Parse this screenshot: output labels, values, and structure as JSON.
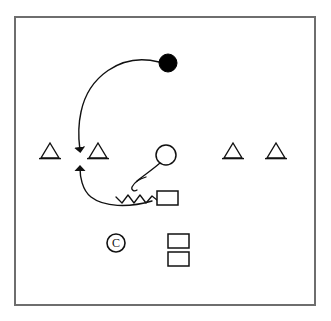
{
  "canvas": {
    "width": 331,
    "height": 321,
    "background": "#ffffff",
    "stroke_color": "#1a1a1a",
    "frame_color": "#6e6e6e"
  },
  "frame": {
    "label": "play-field-border",
    "x": 15,
    "y": 17,
    "width": 300,
    "height": 288,
    "stroke_width": 2
  },
  "legend": {
    "title": "Play Diagram",
    "symbols": [
      {
        "key": "triangle",
        "meaning": "Defender (open triangle)"
      },
      {
        "key": "filled-circle",
        "meaning": "Ball carrier / primary player (filled circle)"
      },
      {
        "key": "open-circle",
        "meaning": "Player (open circle)"
      },
      {
        "key": "rectangle",
        "meaning": "Blocker / lineman (open rectangle)"
      },
      {
        "key": "circled-c",
        "meaning": "Center (circled C)"
      },
      {
        "key": "arrow-path",
        "meaning": "Motion / route with arrowhead"
      },
      {
        "key": "zigzag-path",
        "meaning": "Block / engagement path (zigzag)"
      }
    ]
  },
  "players": {
    "triangles": [
      {
        "name": "defender-1",
        "cx": 50,
        "cy": 158,
        "half_width": 9,
        "height": 15
      },
      {
        "name": "defender-2",
        "cx": 98,
        "cy": 158,
        "half_width": 9,
        "height": 15
      },
      {
        "name": "defender-3",
        "cx": 233,
        "cy": 158,
        "half_width": 9,
        "height": 15
      },
      {
        "name": "defender-4",
        "cx": 276,
        "cy": 158,
        "half_width": 9,
        "height": 15
      }
    ],
    "filled_circle": {
      "name": "ball-carrier",
      "cx": 168,
      "cy": 63,
      "r": 9,
      "fill": "#000000"
    },
    "open_circle": {
      "name": "receiver",
      "cx": 166,
      "cy": 155,
      "r": 10,
      "fill": "#ffffff"
    },
    "circled_c": {
      "name": "center-marker",
      "cx": 116,
      "cy": 243,
      "r": 9,
      "letter": "C"
    },
    "rectangles": [
      {
        "name": "blocker-1",
        "x": 157,
        "y": 191,
        "width": 21,
        "height": 14
      },
      {
        "name": "blocker-2",
        "x": 168,
        "y": 234,
        "width": 21,
        "height": 14
      },
      {
        "name": "blocker-3",
        "x": 168,
        "y": 252,
        "width": 21,
        "height": 14
      }
    ]
  },
  "paths": {
    "upper_route": {
      "name": "ball-carrier-route",
      "d": "M 159 62 C 120 52 88 78 81 112 C 77 130 79 142 80 150",
      "arrow_at": {
        "x": 80,
        "y": 156,
        "direction": "down"
      }
    },
    "lower_route": {
      "name": "blocker-return-route",
      "d": "M 152 201 C 128 208 104 207 91 197 C 82 190 80 176 80 168",
      "arrow_at": {
        "x": 80,
        "y": 160,
        "direction": "up"
      }
    },
    "receiver_stem": {
      "name": "receiver-release-path",
      "d": "M 160 163 C 152 170 143 176 137 181"
    },
    "receiver_hook": {
      "name": "receiver-hook-curl",
      "d": "M 145 183 C 139 181 135 182 133 186 C 132 189 134 191 137 190"
    },
    "zigzag": {
      "name": "engagement-zigzag",
      "points": "116 197 122 203 128 195 134 203 140 195 146 203 152 196 157 200"
    }
  }
}
